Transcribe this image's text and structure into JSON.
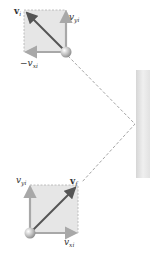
{
  "diagram": {
    "top_box": {
      "label_v": "v",
      "label_v_sub": "i",
      "label_vy": "v",
      "label_vy_sub": "yi",
      "label_vx": "−v",
      "label_vx_sub": "xi"
    },
    "bottom_box": {
      "label_v": "v",
      "label_v_sub": "f",
      "label_vy": "v",
      "label_vy_sub": "yi",
      "label_vx": "v",
      "label_vx_sub": "xi"
    },
    "colors": {
      "box_fill": "#e6e6e6",
      "box_border": "#b0b0b0",
      "component_arrow": "#a8a8a8",
      "velocity_arrow": "#555555",
      "path_dash": "#9a9a9a",
      "wall_light": "#f2f2f2",
      "wall_dark": "#d4d4d4"
    }
  }
}
